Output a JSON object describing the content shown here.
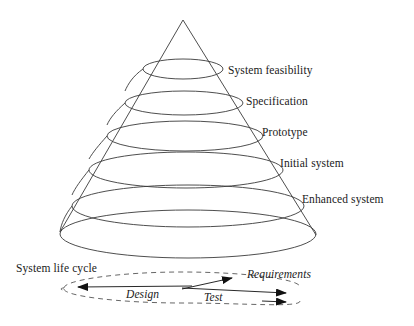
{
  "figure": {
    "kind": "spiral-life-cycle-cone",
    "background_color": "#ffffff",
    "stroke_color": "#333333",
    "text_color": "#1a1a1a"
  },
  "cone": {
    "apex": {
      "x": 183,
      "y": 20
    },
    "base_left": {
      "x": 60,
      "y": 232
    },
    "base_right": {
      "x": 316,
      "y": 235
    },
    "base_center": {
      "x": 188,
      "y": 234
    },
    "base_rx": 128,
    "base_ry": 24
  },
  "stages": [
    {
      "id": "system-feasibility",
      "label": "System feasibility",
      "label_x": 228,
      "label_y": 64,
      "ellipse": {
        "cx": 183,
        "cy": 69,
        "rx": 40,
        "ry": 10
      }
    },
    {
      "id": "specification",
      "label": "Specification",
      "label_x": 246,
      "label_y": 95,
      "ellipse": {
        "cx": 184,
        "cy": 103,
        "rx": 59,
        "ry": 12
      }
    },
    {
      "id": "prototype",
      "label": "Prototype",
      "label_x": 262,
      "label_y": 126,
      "ellipse": {
        "cx": 185,
        "cy": 136,
        "rx": 78,
        "ry": 15
      }
    },
    {
      "id": "initial-system",
      "label": "Initial system",
      "label_x": 280,
      "label_y": 157,
      "ellipse": {
        "cx": 186,
        "cy": 170,
        "rx": 97,
        "ry": 18
      }
    },
    {
      "id": "enhanced-system",
      "label": "Enhanced system",
      "label_x": 302,
      "label_y": 193,
      "ellipse": {
        "cx": 188,
        "cy": 206,
        "rx": 116,
        "ry": 21
      }
    }
  ],
  "life_cycle": {
    "label": "System life cycle",
    "label_x": 16,
    "label_y": 262,
    "dashed_loop": {
      "cx": 182,
      "cy": 288,
      "rx": 118,
      "ry": 14,
      "dash": "5 4"
    },
    "arrows": [
      {
        "id": "design-arrow",
        "label": "Design",
        "label_x": 126,
        "label_y": 288,
        "direction": "left",
        "from": {
          "x": 192,
          "y": 286
        },
        "to": {
          "x": 66,
          "y": 287
        }
      },
      {
        "id": "requirements-arrow",
        "label": "Requirements",
        "label_x": 247,
        "label_y": 268,
        "direction": "up-right",
        "from": {
          "x": 186,
          "y": 288
        },
        "to": {
          "x": 241,
          "y": 276
        }
      },
      {
        "id": "test-arrow",
        "label": "Test",
        "label_x": 204,
        "label_y": 291,
        "direction": "right",
        "from": {
          "x": 186,
          "y": 287
        },
        "to": {
          "x": 296,
          "y": 293
        }
      },
      {
        "id": "outer-loop-arrow",
        "label": "",
        "direction": "right",
        "from": {
          "x": 250,
          "y": 301
        },
        "to": {
          "x": 296,
          "y": 302
        }
      }
    ]
  }
}
